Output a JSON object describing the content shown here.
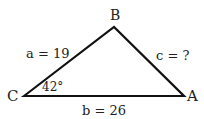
{
  "diagram": {
    "type": "triangle",
    "vertices": {
      "A": {
        "label": "A"
      },
      "B": {
        "label": "B"
      },
      "C": {
        "label": "C"
      }
    },
    "sides": {
      "a": {
        "label": "a = 19",
        "between": [
          "B",
          "C"
        ]
      },
      "b": {
        "label": "b = 26",
        "between": [
          "C",
          "A"
        ]
      },
      "c": {
        "label": "c = ?",
        "between": [
          "A",
          "B"
        ]
      }
    },
    "angles": {
      "C": {
        "label": "42°"
      }
    },
    "colors": {
      "stroke": "#111111",
      "text": "#222222",
      "background": "#ffffff"
    }
  }
}
